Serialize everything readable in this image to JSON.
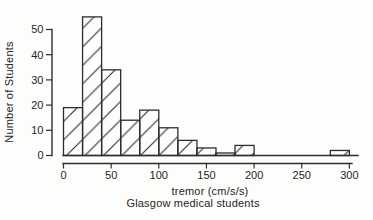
{
  "chart_data": {
    "type": "bar",
    "subtype": "histogram",
    "title": "",
    "xlabel": "tremor (cm/s/s)",
    "ylabel": "Number of Students",
    "caption": "Glasgow medical students",
    "bin_width": 20,
    "bin_starts": [
      0,
      20,
      40,
      60,
      80,
      100,
      120,
      140,
      160,
      180,
      200,
      220,
      240,
      260,
      280
    ],
    "values": [
      19,
      55,
      34,
      14,
      18,
      11,
      6,
      3,
      1,
      4,
      0,
      0,
      0,
      0,
      2
    ],
    "x_ticks": [
      0,
      50,
      100,
      150,
      200,
      250,
      300
    ],
    "y_ticks": [
      0,
      10,
      20,
      30,
      40,
      50
    ],
    "xlim": [
      0,
      310
    ],
    "ylim": [
      0,
      57
    ],
    "grid": false,
    "legend": "none",
    "fill_style": "diagonal-hatch-forward",
    "colors": {
      "stroke": "#2d2d2d",
      "bar_fill": "none",
      "background": "#fdfdfb",
      "text": "#262626"
    }
  }
}
